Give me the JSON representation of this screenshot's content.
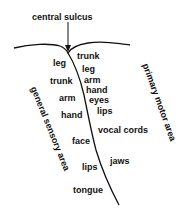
{
  "title": "central sulcus",
  "side_labels": {
    "left": "general sensory area",
    "right": "primary motor area"
  },
  "sensory_labels": [
    {
      "text": "leg",
      "x": 53,
      "y": 58
    },
    {
      "text": "trunk",
      "x": 50,
      "y": 76
    },
    {
      "text": "arm",
      "x": 59,
      "y": 93
    },
    {
      "text": "hand",
      "x": 61,
      "y": 110
    },
    {
      "text": "face",
      "x": 72,
      "y": 136
    },
    {
      "text": "lips",
      "x": 82,
      "y": 162
    },
    {
      "text": "tongue",
      "x": 73,
      "y": 185
    }
  ],
  "motor_labels": [
    {
      "text": "trunk",
      "x": 77,
      "y": 51
    },
    {
      "text": "leg",
      "x": 82,
      "y": 64
    },
    {
      "text": "arm",
      "x": 84,
      "y": 75
    },
    {
      "text": "hand",
      "x": 86,
      "y": 85
    },
    {
      "text": "eyes",
      "x": 89,
      "y": 95
    },
    {
      "text": "lips",
      "x": 97,
      "y": 106
    },
    {
      "text": "vocal cords",
      "x": 98,
      "y": 125
    },
    {
      "text": "jaws",
      "x": 110,
      "y": 156
    }
  ],
  "colors": {
    "ink": "#111111",
    "background": "#ffffff"
  }
}
